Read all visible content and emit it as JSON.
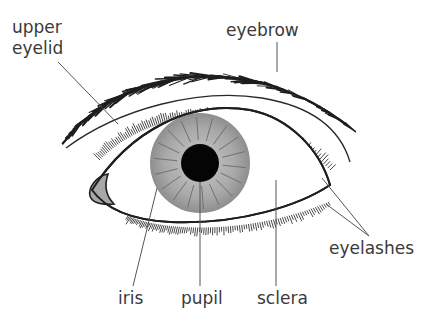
{
  "diagram": {
    "labels": {
      "upper_eyelid_line1": "upper",
      "upper_eyelid_line2": "eyelid",
      "eyebrow": "eyebrow",
      "eyelashes": "eyelashes",
      "iris": "iris",
      "pupil": "pupil",
      "sclera": "sclera"
    },
    "colors": {
      "outline": "#2a2a2a",
      "iris": "#a8a8a8",
      "iris_edge": "#8a8a8a",
      "pupil": "#050505",
      "leader": "#555555",
      "text": "#3a3a3a"
    }
  }
}
